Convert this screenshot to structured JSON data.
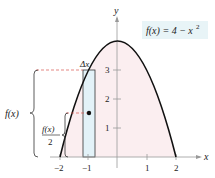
{
  "diagram": {
    "function_label": "f(x) = 4 − x",
    "function_exponent": "2",
    "axis_x_label": "x",
    "axis_y_label": "y",
    "x_ticks": [
      "−2",
      "−1",
      "1",
      "2"
    ],
    "y_ticks": [
      "1",
      "2",
      "3"
    ],
    "delta_label": "Δx",
    "fx_label": "f(x)",
    "fx_half_numerator": "f(x)",
    "fx_half_denominator": "2",
    "colors": {
      "curve": "#111111",
      "region_fill": "#fbeef0",
      "rect_fill": "#e3f2f8",
      "label_box": "#e8f4f7",
      "dashed": "#d9534f",
      "axis": "#888888"
    }
  }
}
